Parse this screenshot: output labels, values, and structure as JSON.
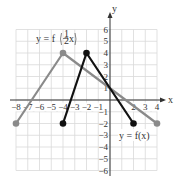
{
  "chart_data": {
    "type": "line",
    "title": "",
    "xlabel": "x",
    "ylabel": "y",
    "xlim": [
      -8,
      4
    ],
    "ylim": [
      -6,
      6
    ],
    "grid": true,
    "x_ticks": [
      -8,
      -7,
      -6,
      -5,
      -4,
      -3,
      -2,
      -1,
      2,
      3,
      4
    ],
    "x_tick_labels": [
      "−8",
      "−7",
      "−6",
      "−5",
      "−4",
      "−3",
      "−2",
      "−1",
      "2",
      "3",
      "4"
    ],
    "y_ticks": [
      6,
      5,
      4,
      3,
      2,
      1,
      -1,
      -2,
      -3,
      -4,
      -5,
      -6
    ],
    "y_tick_labels": [
      "6",
      "5",
      "4",
      "3",
      "2",
      "1",
      "−1",
      "−2",
      "−3",
      "−4",
      "−5",
      "−6"
    ],
    "series": [
      {
        "name": "y = f(x)",
        "color": "#111111",
        "points": [
          [
            -4,
            -2
          ],
          [
            -2,
            4
          ],
          [
            2,
            -2
          ]
        ],
        "endpoints_closed": true
      },
      {
        "name": "y = f(½x)",
        "color": "#8a8a8a",
        "points": [
          [
            -8,
            -2
          ],
          [
            -4,
            4
          ],
          [
            4,
            -2
          ]
        ],
        "endpoints_closed": true
      }
    ],
    "annotations": [
      {
        "text": "y = f(½x)",
        "near": [
          -6,
          5
        ]
      },
      {
        "text": "y = f(x)",
        "near": [
          2.3,
          -2.9
        ]
      }
    ]
  },
  "labels": {
    "x_axis": "x",
    "y_axis": "y",
    "f_half_prefix": "y = f",
    "f_half_num": "1",
    "f_half_den": "2",
    "f_half_var": "x",
    "f_x": "y = f(x)"
  },
  "colors": {
    "grid": "#d9d9d9",
    "axis": "#333333",
    "f": "#111111",
    "f_half": "#8a8a8a"
  }
}
